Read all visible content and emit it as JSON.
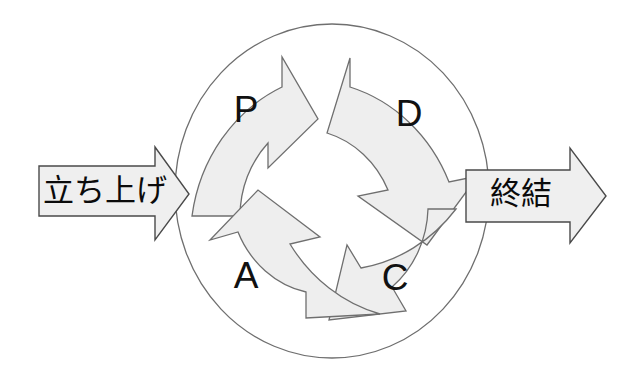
{
  "diagram": {
    "type": "pdca-cycle",
    "title": "",
    "cycle": {
      "shape": "ellipse",
      "center": {
        "x": 332,
        "y": 191
      },
      "radius_x": 157,
      "radius_y": 167,
      "stroke_color": "#6f6f6f"
    },
    "quadrants": [
      {
        "key": "plan",
        "label": "P",
        "position": "top-left",
        "direction": "clockwise",
        "label_x": 246,
        "label_y": 112
      },
      {
        "key": "do",
        "label": "D",
        "position": "top-right",
        "direction": "clockwise",
        "label_x": 409,
        "label_y": 116
      },
      {
        "key": "check",
        "label": "C",
        "position": "bottom-right",
        "direction": "clockwise",
        "label_x": 395,
        "label_y": 280
      },
      {
        "key": "act",
        "label": "A",
        "position": "bottom-left",
        "direction": "clockwise",
        "label_x": 246,
        "label_y": 278
      }
    ],
    "flow_arrows": [
      {
        "key": "start",
        "label": "立ち上げ",
        "side": "left",
        "points_to": "right",
        "label_x": 105,
        "label_y": 192,
        "fill_color": "#efefef",
        "stroke_color": "#4a4a4a"
      },
      {
        "key": "end",
        "label": "終結",
        "side": "right",
        "points_to": "right",
        "label_x": 524,
        "label_y": 195,
        "fill_color": "#efefef",
        "stroke_color": "#4a4a4a"
      }
    ],
    "colors": {
      "background": "#ffffff",
      "arrow_fill": "#eeeeee",
      "arrow_stroke": "#6f6f6f",
      "text": "#111111"
    }
  }
}
